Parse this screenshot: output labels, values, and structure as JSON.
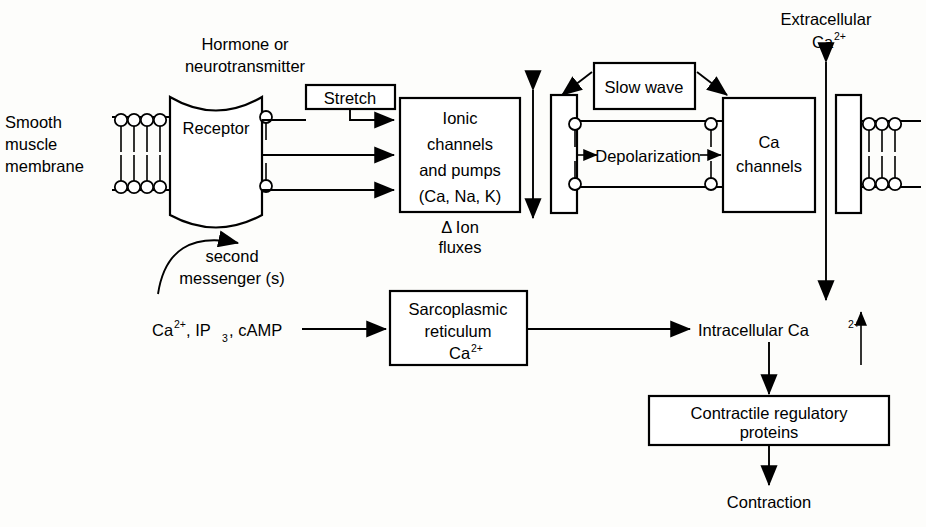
{
  "diagram": {
    "labels": {
      "hormone_line1": "Hormone or",
      "hormone_line2": "neurotransmitter",
      "membrane_line1": "Smooth",
      "membrane_line2": "muscle",
      "membrane_line3": "membrane",
      "receptor": "Receptor",
      "second_line1": "second",
      "second_line2": "messenger (s)",
      "stretch": "Stretch",
      "ionic_line1": "Ionic",
      "ionic_line2": "channels",
      "ionic_line3": "and  pumps",
      "ionic_line4": "(Ca, Na, K)",
      "ion_flux_line1": "Δ  Ion",
      "ion_flux_line2": "fluxes",
      "slow_wave": "Slow wave",
      "depolarization": "Depolarization",
      "ca_channels_line1": "Ca",
      "ca_channels_line2": "channels",
      "extracellular_line1": "Extracellular",
      "extracellular_ion_base": "Ca",
      "extracellular_ion_sup": "2+",
      "second_messengers_list_base": "Ca",
      "second_messengers_list_sup": "2+",
      "second_messengers_list_rest": ", IP",
      "second_messengers_list_sub": "3",
      "second_messengers_list_tail": ", cAMP",
      "sarco_line1": "Sarcoplasmic",
      "sarco_line2": "reticulum",
      "sarco_line3_base": "Ca",
      "sarco_line3_sup": "2+",
      "intracellular_base": "Intracellular  Ca",
      "intracellular_sup": "2+",
      "contractile_line1": "Contractile  regulatory",
      "contractile_line2": "proteins",
      "contraction": "Contraction"
    },
    "colors": {
      "ink": "#000000",
      "paper": "#fdfdfb"
    }
  }
}
